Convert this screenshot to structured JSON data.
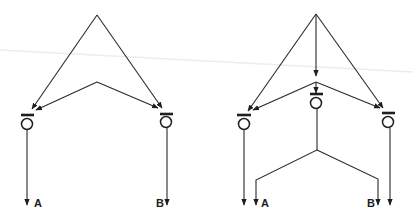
{
  "colors": {
    "ink": "#1e1e1e",
    "background": "#ffffff"
  },
  "diagrams": [
    {
      "id": "left",
      "description": "Two-unit circuit: shared sources converge on two output units A and B",
      "nodes": [
        {
          "id": "L1",
          "cx": 27,
          "cy": 124
        },
        {
          "id": "L2",
          "cx": 166,
          "cy": 122
        }
      ],
      "outputs": [
        {
          "label": "A"
        },
        {
          "label": "B"
        }
      ]
    },
    {
      "id": "right",
      "description": "Three-unit circuit: center unit diverges to both A and B outputs alongside two flanking units",
      "nodes": [
        {
          "id": "R1",
          "cx": 244,
          "cy": 125
        },
        {
          "id": "R2",
          "cx": 316,
          "cy": 103
        },
        {
          "id": "R3",
          "cx": 388,
          "cy": 122
        }
      ],
      "outputs": [
        {
          "label": "A"
        },
        {
          "label": "B"
        }
      ]
    }
  ]
}
